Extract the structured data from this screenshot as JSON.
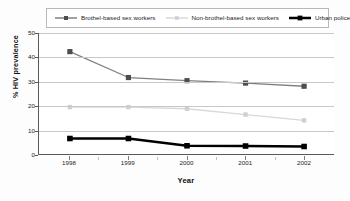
{
  "chart_data": {
    "type": "line",
    "title": "",
    "xlabel": "Year",
    "ylabel": "% HIV prevalence",
    "categories": [
      "1998",
      "1999",
      "2000",
      "2001",
      "2002"
    ],
    "x": [
      1998,
      1999,
      2000,
      2001,
      2002
    ],
    "xlim": [
      1997.6,
      2002.4
    ],
    "ylim": [
      0,
      50
    ],
    "yticks": [
      0,
      10,
      20,
      30,
      40,
      50
    ],
    "ytick_labels": [
      "0",
      "10",
      "20",
      "30",
      "40",
      "50"
    ],
    "xtick_labels": [
      "1998",
      "1999",
      "2000",
      "2001",
      "2002"
    ],
    "grid": "horizontal",
    "legend_position": "top",
    "series": [
      {
        "name": "Brothel-based sex workers",
        "values": [
          42.3,
          31.6,
          30.3,
          29.3,
          28.0
        ],
        "color": "#808080",
        "line_width": 1.3,
        "marker": "square",
        "marker_size": 2.6,
        "marker_color": "#4d4d4d"
      },
      {
        "name": "Non-brothel-based sex workers",
        "values": [
          19.4,
          19.4,
          18.7,
          16.3,
          13.9
        ],
        "color": "#d8d8d8",
        "line_width": 1.3,
        "marker": "square",
        "marker_size": 2.2,
        "marker_color": "#cfcfcf"
      },
      {
        "name": "Urban police",
        "values": [
          6.4,
          6.4,
          3.4,
          3.3,
          3.1
        ],
        "color": "#000000",
        "line_width": 2.4,
        "marker": "square",
        "marker_size": 2.8,
        "marker_color": "#000000"
      }
    ],
    "colors": {
      "axis": "#5a5a5a",
      "grid": "#c8c8c8",
      "text": "#1a1a1a",
      "background": "#ffffff",
      "legend_border": "#b9b9b9"
    }
  },
  "legend": {
    "items": [
      {
        "label": "Brothel-based sex workers"
      },
      {
        "label": "Non-brothel-based sex workers"
      },
      {
        "label": "Urban police"
      }
    ]
  },
  "axes": {
    "y_title": "% HIV prevalence",
    "x_title": "Year"
  }
}
